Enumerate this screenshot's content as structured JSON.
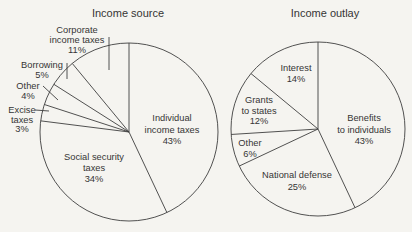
{
  "figure_title": "Income source and income outlay pie charts",
  "chart_data": [
    {
      "type": "pie",
      "title": "Income source",
      "unit": "percent",
      "start_angle_deg": 0,
      "direction": "clockwise",
      "legend": "none (direct labels on/around slices)",
      "slices": [
        {
          "label": "Individual income taxes",
          "value": 43,
          "pct_label": "43%",
          "label_lines": [
            "Individual",
            "income taxes"
          ],
          "label_placement": "inside"
        },
        {
          "label": "Social security taxes",
          "value": 34,
          "pct_label": "34%",
          "label_lines": [
            "Social security",
            "taxes"
          ],
          "label_placement": "inside"
        },
        {
          "label": "Excise taxes",
          "value": 3,
          "pct_label": "3%",
          "label_lines": [
            "Excise",
            "taxes"
          ],
          "label_placement": "outside"
        },
        {
          "label": "Other",
          "value": 4,
          "pct_label": "4%",
          "label_lines": [
            "Other"
          ],
          "label_placement": "outside"
        },
        {
          "label": "Borrowing",
          "value": 5,
          "pct_label": "5%",
          "label_lines": [
            "Borrowing"
          ],
          "label_placement": "outside"
        },
        {
          "label": "Corporate income taxes",
          "value": 11,
          "pct_label": "11%",
          "label_lines": [
            "Corporate",
            "income taxes"
          ],
          "label_placement": "outside"
        }
      ]
    },
    {
      "type": "pie",
      "title": "Income outlay",
      "unit": "percent",
      "start_angle_deg": 0,
      "direction": "clockwise",
      "legend": "none (direct labels on slices)",
      "slices": [
        {
          "label": "Benefits to individuals",
          "value": 43,
          "pct_label": "43%",
          "label_lines": [
            "Benefits",
            "to individuals"
          ],
          "label_placement": "inside"
        },
        {
          "label": "National defense",
          "value": 25,
          "pct_label": "25%",
          "label_lines": [
            "National defense"
          ],
          "label_placement": "inside"
        },
        {
          "label": "Other",
          "value": 6,
          "pct_label": "6%",
          "label_lines": [
            "Other"
          ],
          "label_placement": "inside"
        },
        {
          "label": "Grants to states",
          "value": 12,
          "pct_label": "12%",
          "label_lines": [
            "Grants",
            "to states"
          ],
          "label_placement": "inside"
        },
        {
          "label": "Interest",
          "value": 14,
          "pct_label": "14%",
          "label_lines": [
            "Interest"
          ],
          "label_placement": "inside"
        }
      ]
    }
  ],
  "ink_color": "#3e3e3e",
  "paper_color": "#f5f4f0"
}
